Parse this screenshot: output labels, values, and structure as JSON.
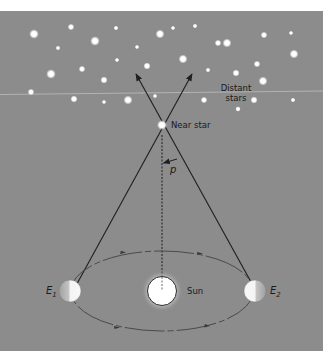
{
  "diagram": {
    "type": "stellar-parallax",
    "colors": {
      "page": "#ffffff",
      "panel": "#8c8c8c",
      "star": "#ffffff",
      "line": "#1e1e1e",
      "orbit": "#4a4a4a",
      "horizon_line": "#b8b8b8",
      "sun_fill": "#ffffff",
      "earth_lit": "#f4f4f4",
      "earth_dark": "#a8a8a8"
    },
    "labels": {
      "distant_stars_line1": "Distant",
      "distant_stars_line2": "stars",
      "near_star": "Near star",
      "parallax_angle": "p",
      "sun": "Sun",
      "earth1_letter": "E",
      "earth1_sub": "1",
      "earth2_letter": "E",
      "earth2_sub": "2"
    },
    "stars": [
      {
        "x": 34,
        "y": 34,
        "r": 3.2
      },
      {
        "x": 71,
        "y": 27,
        "r": 2.2
      },
      {
        "x": 95,
        "y": 41,
        "r": 3.2
      },
      {
        "x": 116,
        "y": 28,
        "r": 1.6
      },
      {
        "x": 58,
        "y": 48,
        "r": 1.6
      },
      {
        "x": 51,
        "y": 74,
        "r": 3.2
      },
      {
        "x": 82,
        "y": 69,
        "r": 2.2
      },
      {
        "x": 104,
        "y": 80,
        "r": 2.4
      },
      {
        "x": 117,
        "y": 60,
        "r": 1.5
      },
      {
        "x": 137,
        "y": 47,
        "r": 1.5
      },
      {
        "x": 147,
        "y": 66,
        "r": 2.4
      },
      {
        "x": 160,
        "y": 34,
        "r": 3.0
      },
      {
        "x": 31,
        "y": 92,
        "r": 2.2
      },
      {
        "x": 74,
        "y": 99,
        "r": 2.4
      },
      {
        "x": 104,
        "y": 102,
        "r": 1.5
      },
      {
        "x": 128,
        "y": 100,
        "r": 3.0
      },
      {
        "x": 155,
        "y": 96,
        "r": 1.5
      },
      {
        "x": 183,
        "y": 59,
        "r": 3.0
      },
      {
        "x": 195,
        "y": 26,
        "r": 1.6
      },
      {
        "x": 218,
        "y": 43,
        "r": 2.2
      },
      {
        "x": 227,
        "y": 43,
        "r": 3.0
      },
      {
        "x": 208,
        "y": 70,
        "r": 1.6
      },
      {
        "x": 236,
        "y": 73,
        "r": 2.4
      },
      {
        "x": 257,
        "y": 64,
        "r": 2.2
      },
      {
        "x": 263,
        "y": 81,
        "r": 3.0
      },
      {
        "x": 264,
        "y": 35,
        "r": 2.2
      },
      {
        "x": 291,
        "y": 33,
        "r": 1.5
      },
      {
        "x": 294,
        "y": 54,
        "r": 3.0
      },
      {
        "x": 204,
        "y": 100,
        "r": 2.2
      },
      {
        "x": 254,
        "y": 100,
        "r": 2.4
      },
      {
        "x": 293,
        "y": 100,
        "r": 1.6
      },
      {
        "x": 238,
        "y": 109,
        "r": 1.8
      },
      {
        "x": 173,
        "y": 28,
        "r": 1.5
      }
    ]
  }
}
